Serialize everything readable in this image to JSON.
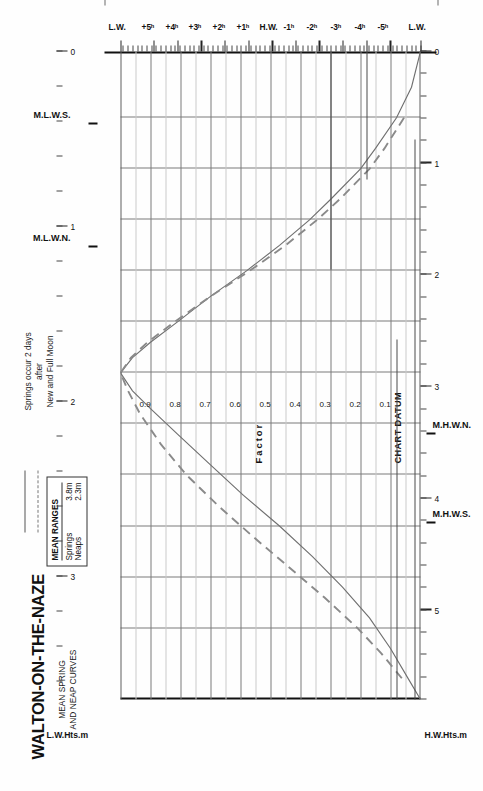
{
  "title": "WALTON-ON-THE-NAZE",
  "subtitle_line1": "MEAN SPRING",
  "subtitle_line2": "AND NEAP CURVES",
  "legend": {
    "header": "MEAN RANGES",
    "rows": [
      {
        "name": "Springs",
        "value": "3.8m",
        "style": "solid"
      },
      {
        "name": "Neaps",
        "value": "2.3m",
        "style": "dashed"
      }
    ]
  },
  "note_line1": "Springs occur 2 days",
  "note_line2": "after",
  "note_line3": "New and Full Moon",
  "factor_axis_title": "Factor",
  "chart_datum_label": "CHART DATUM",
  "left_axis_title": "H.W.Hts.m",
  "right_axis_title": "L.W.Hts.m",
  "level_labels": {
    "mhws": "M.H.W.S.",
    "mhwn": "M.H.W.N.",
    "mlwn": "M.L.W.N.",
    "mlws": "M.L.W.S."
  },
  "chart_data": {
    "type": "line",
    "xlabel": "Factor",
    "ylabel": "Time from High Water (hours)",
    "grid": true,
    "legend_position": "top-left",
    "factor_ticks": [
      "0.9",
      "0.8",
      "0.7",
      "0.6",
      "0.5",
      "0.4",
      "0.3",
      "0.2",
      "0.1"
    ],
    "factor_values": [
      0.9,
      0.8,
      0.7,
      0.6,
      0.5,
      0.4,
      0.3,
      0.2,
      0.1
    ],
    "factor_range": [
      1.0,
      0.0
    ],
    "time_ticks": [
      "L.W.",
      "+5ʰ",
      "+4ʰ",
      "+3ʰ",
      "+2ʰ",
      "+1ʰ",
      "H.W.",
      "-1ʰ",
      "-2ʰ",
      "-3ʰ",
      "-4ʰ",
      "-5ʰ",
      "L.W."
    ],
    "time_values": [
      6.4,
      5,
      4,
      3,
      2,
      1,
      0,
      -1,
      -2,
      -3,
      -4,
      -5,
      -6.3
    ],
    "hw_height_ticks": [
      "0",
      "1",
      "2",
      "3",
      "4",
      "5"
    ],
    "hw_height_range": [
      0,
      5.8
    ],
    "lw_height_ticks": [
      "0",
      "1",
      "2",
      "3"
    ],
    "lw_height_range": [
      0,
      3.7
    ],
    "mean_ranges": {
      "springs_m": 3.8,
      "neaps_m": 2.3
    },
    "levels": {
      "M.H.W.S.": 4.2,
      "M.H.W.N.": 3.4,
      "M.L.W.N.": 1.1,
      "M.L.W.S.": 0.4
    },
    "series": [
      {
        "name": "Springs",
        "style": "solid",
        "points": [
          {
            "t": -6.3,
            "factor": 0.0
          },
          {
            "t": -5.6,
            "factor": 0.03
          },
          {
            "t": -5.0,
            "factor": 0.08
          },
          {
            "t": -4.4,
            "factor": 0.15
          },
          {
            "t": -4.0,
            "factor": 0.2
          },
          {
            "t": -3.4,
            "factor": 0.3
          },
          {
            "t": -3.0,
            "factor": 0.37
          },
          {
            "t": -2.5,
            "factor": 0.47
          },
          {
            "t": -2.0,
            "factor": 0.58
          },
          {
            "t": -1.5,
            "factor": 0.7
          },
          {
            "t": -1.0,
            "factor": 0.81
          },
          {
            "t": -0.6,
            "factor": 0.9
          },
          {
            "t": -0.3,
            "factor": 0.96
          },
          {
            "t": 0.0,
            "factor": 1.0
          },
          {
            "t": 0.35,
            "factor": 0.96
          },
          {
            "t": 0.7,
            "factor": 0.9
          },
          {
            "t": 1.2,
            "factor": 0.81
          },
          {
            "t": 1.8,
            "factor": 0.7
          },
          {
            "t": 2.4,
            "factor": 0.59
          },
          {
            "t": 3.0,
            "factor": 0.47
          },
          {
            "t": 3.6,
            "factor": 0.36
          },
          {
            "t": 4.2,
            "factor": 0.26
          },
          {
            "t": 4.8,
            "factor": 0.17
          },
          {
            "t": 5.4,
            "factor": 0.1
          },
          {
            "t": 6.0,
            "factor": 0.04
          },
          {
            "t": 6.4,
            "factor": 0.0
          }
        ]
      },
      {
        "name": "Neaps",
        "style": "dashed",
        "points": [
          {
            "t": -5.0,
            "factor": 0.055
          },
          {
            "t": -4.4,
            "factor": 0.12
          },
          {
            "t": -4.0,
            "factor": 0.17
          },
          {
            "t": -3.4,
            "factor": 0.27
          },
          {
            "t": -3.0,
            "factor": 0.345
          },
          {
            "t": -2.5,
            "factor": 0.45
          },
          {
            "t": -2.0,
            "factor": 0.57
          },
          {
            "t": -1.5,
            "factor": 0.7
          },
          {
            "t": -1.0,
            "factor": 0.82
          },
          {
            "t": -0.6,
            "factor": 0.91
          },
          {
            "t": -0.3,
            "factor": 0.965
          },
          {
            "t": 0.0,
            "factor": 1.0
          },
          {
            "t": 0.35,
            "factor": 0.975
          },
          {
            "t": 0.8,
            "factor": 0.935
          },
          {
            "t": 1.4,
            "factor": 0.865
          },
          {
            "t": 2.0,
            "factor": 0.78
          },
          {
            "t": 2.6,
            "factor": 0.675
          },
          {
            "t": 3.2,
            "factor": 0.56
          },
          {
            "t": 3.8,
            "factor": 0.44
          },
          {
            "t": 4.4,
            "factor": 0.32
          },
          {
            "t": 5.0,
            "factor": 0.21
          },
          {
            "t": 5.5,
            "factor": 0.13
          },
          {
            "t": 6.0,
            "factor": 0.06
          }
        ]
      }
    ]
  }
}
